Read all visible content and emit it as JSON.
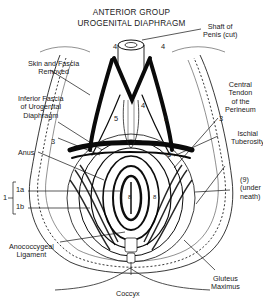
{
  "title": {
    "line1": "ANTERIOR GROUP",
    "line2": "UROGENITAL DIAPHRAGM"
  },
  "labels": {
    "shaft_of_penis": [
      "Shaft of",
      "Penis (cut)"
    ],
    "skin_and_fascia": [
      "Skin and Fascia",
      "Removed"
    ],
    "inferior_fascia": [
      "Inferior Fascia",
      "of Urogenital",
      "Diaphragm"
    ],
    "central_tendon": [
      "Central",
      "Tendon",
      "of the",
      "Perineum"
    ],
    "ischial_tuberosity": [
      "Ischial",
      "Tuberosity"
    ],
    "anus": "Anus",
    "under_neath": [
      "(9)",
      "(under",
      "neath)"
    ],
    "anococcygeal": [
      "Anococcygeal",
      "Ligament"
    ],
    "gluteus_maximus": [
      "Gluteus",
      "Maximus"
    ],
    "coccyx": "Coccyx"
  },
  "numbers": {
    "n4_left": "4",
    "n4_right": "4",
    "n4_center": "4",
    "n5_left": "5",
    "n5_right": "5",
    "n3_left": "3",
    "n3_right": "3",
    "n6_right": "6",
    "n8_left": "8",
    "n8_right": "8",
    "n1": "1",
    "n1a": "1a",
    "n1b": "1b"
  }
}
